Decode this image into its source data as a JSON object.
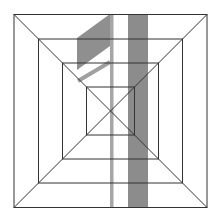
{
  "figure": {
    "width": 220,
    "height": 222,
    "colors": {
      "background": "#ffffff",
      "line": "#333333",
      "band_dark": "#8c8c8c",
      "band_light": "#a6a6a6"
    },
    "center": [
      110.5,
      111
    ],
    "square_half_sizes": [
      96.5,
      72,
      48,
      24
    ],
    "bands": [
      {
        "name": "thin-band",
        "x": 110,
        "y": 14,
        "w": 3.5,
        "h": 194
      },
      {
        "name": "thick-band",
        "x": 128,
        "y": 14,
        "w": 20,
        "h": 194
      }
    ],
    "flag_polygon": "77,38 110,14 110,46 77,70",
    "stroke_line": {
      "x1": 78,
      "y1": 81,
      "x2": 110,
      "y2": 62,
      "width": 4
    }
  }
}
